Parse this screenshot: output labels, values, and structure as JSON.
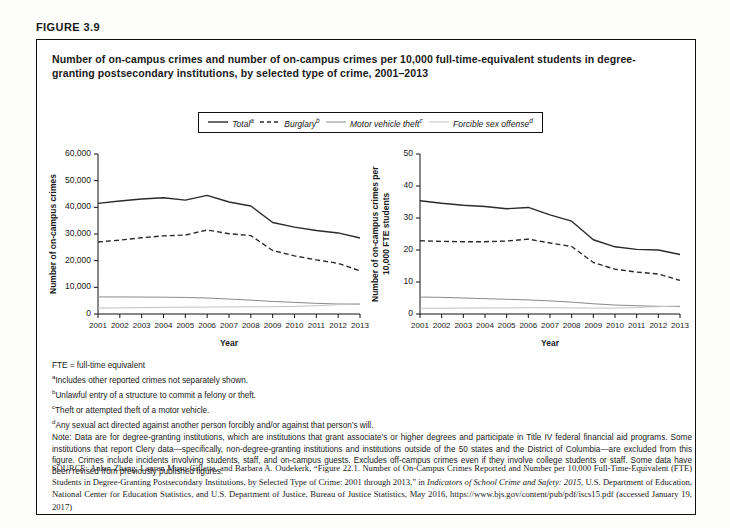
{
  "figure_label": "FIGURE 3.9",
  "title": "Number of on-campus crimes and number of on-campus crimes per 10,000 full-time-equivalent students in degree-granting postsecondary institutions, by selected type of crime, 2001–2013",
  "legend": {
    "position": "top-center-boxed",
    "entries": [
      {
        "label": "Total",
        "sup": "a",
        "style": "solid",
        "color": "#2a2a2a",
        "width": 1.4
      },
      {
        "label": "Burglary",
        "sup": "b",
        "style": "dashed",
        "color": "#2a2a2a",
        "width": 1.4
      },
      {
        "label": "Motor vehicle theft",
        "sup": "c",
        "style": "solid",
        "color": "#8a8a8a",
        "width": 1.0
      },
      {
        "label": "Forcible sex offense",
        "sup": "d",
        "style": "solid",
        "color": "#c2c2c2",
        "width": 1.0
      }
    ]
  },
  "chart_data": [
    {
      "type": "line",
      "panel": "left",
      "title": "",
      "xlabel": "Year",
      "ylabel": "Number of on-campus crimes",
      "x": [
        2001,
        2002,
        2003,
        2004,
        2005,
        2006,
        2007,
        2008,
        2009,
        2010,
        2011,
        2012,
        2013
      ],
      "xticklabels": [
        "2001",
        "2002",
        "2003",
        "2004",
        "2005",
        "2006",
        "2007",
        "2008",
        "2009",
        "2010",
        "2011",
        "2012",
        "2013"
      ],
      "ylim": [
        0,
        60000
      ],
      "yticks": [
        0,
        10000,
        20000,
        30000,
        40000,
        50000,
        60000
      ],
      "yticklabels": [
        "0",
        "10,000",
        "20,000",
        "30,000",
        "40,000",
        "50,000",
        "60,000"
      ],
      "grid": false,
      "series": [
        {
          "name": "Total",
          "sup": "a",
          "style": "solid",
          "color": "#2a2a2a",
          "width": 1.4,
          "values": [
            41500,
            42400,
            43100,
            43600,
            42700,
            44500,
            42000,
            40500,
            34300,
            32600,
            31300,
            30400,
            28500
          ]
        },
        {
          "name": "Burglary",
          "sup": "b",
          "style": "dashed",
          "color": "#2a2a2a",
          "width": 1.4,
          "values": [
            27000,
            27700,
            28600,
            29300,
            29600,
            31500,
            30100,
            29400,
            23800,
            21800,
            20300,
            19000,
            16200
          ]
        },
        {
          "name": "Motor vehicle theft",
          "sup": "c",
          "style": "solid",
          "color": "#8a8a8a",
          "width": 1.0,
          "values": [
            6400,
            6400,
            6350,
            6300,
            6200,
            6000,
            5600,
            5200,
            4700,
            4350,
            4000,
            3750,
            3700
          ]
        },
        {
          "name": "Forcible sex offense",
          "sup": "d",
          "style": "solid",
          "color": "#c2c2c2",
          "width": 1.0,
          "values": [
            2200,
            2300,
            2400,
            2500,
            2550,
            2600,
            2650,
            2700,
            2750,
            2850,
            3100,
            3500,
            3900
          ]
        }
      ]
    },
    {
      "type": "line",
      "panel": "right",
      "title": "",
      "xlabel": "Year",
      "ylabel": "Number of on-campus crimes per 10,000 FTE students",
      "x": [
        2001,
        2002,
        2003,
        2004,
        2005,
        2006,
        2007,
        2008,
        2009,
        2010,
        2011,
        2012,
        2013
      ],
      "xticklabels": [
        "2001",
        "2002",
        "2003",
        "2004",
        "2005",
        "2006",
        "2007",
        "2008",
        "2009",
        "2010",
        "2011",
        "2012",
        "2013"
      ],
      "ylim": [
        0,
        50
      ],
      "yticks": [
        0,
        10,
        20,
        30,
        40,
        50
      ],
      "yticklabels": [
        "0",
        "10",
        "20",
        "30",
        "40",
        "50"
      ],
      "grid": false,
      "series": [
        {
          "name": "Total",
          "sup": "a",
          "style": "solid",
          "color": "#2a2a2a",
          "width": 1.4,
          "values": [
            35.4,
            34.6,
            34.0,
            33.6,
            32.9,
            33.3,
            31.0,
            29.0,
            23.2,
            21.0,
            20.2,
            20.0,
            18.6
          ]
        },
        {
          "name": "Burglary",
          "sup": "b",
          "style": "dashed",
          "color": "#2a2a2a",
          "width": 1.4,
          "values": [
            22.9,
            22.7,
            22.6,
            22.6,
            22.8,
            23.4,
            22.2,
            21.1,
            16.1,
            14.0,
            13.1,
            12.5,
            10.5
          ]
        },
        {
          "name": "Motor vehicle theft",
          "sup": "c",
          "style": "solid",
          "color": "#8a8a8a",
          "width": 1.0,
          "values": [
            5.3,
            5.2,
            5.0,
            4.8,
            4.6,
            4.4,
            4.1,
            3.7,
            3.2,
            2.8,
            2.6,
            2.4,
            2.3
          ]
        },
        {
          "name": "Forcible sex offense",
          "sup": "d",
          "style": "solid",
          "color": "#c2c2c2",
          "width": 1.0,
          "values": [
            1.8,
            1.8,
            1.85,
            1.9,
            1.9,
            1.95,
            1.95,
            1.9,
            1.85,
            1.85,
            2.0,
            2.3,
            2.5
          ]
        }
      ]
    }
  ],
  "notes": {
    "abbrev": "FTE = full-time equivalent",
    "footnotes": [
      {
        "marker": "a",
        "text": "Includes other reported crimes not separately shown."
      },
      {
        "marker": "b",
        "text": "Unlawful entry of a structure to commit a felony or theft."
      },
      {
        "marker": "c",
        "text": "Theft or attempted theft of a motor vehicle."
      },
      {
        "marker": "d",
        "text": "Any sexual act directed against another person forcibly and/or against that person’s will."
      }
    ],
    "note": "Note: Data are for degree-granting institutions, which are institutions that grant associate’s or higher degrees and participate in Title IV federal financial aid programs. Some institutions that report Clery data—specifically, non-degree-granting institutions and institutions outside of the 50 states and the District of Columbia—are excluded from this figure. Crimes include incidents involving students, staff, and on-campus guests. Excludes off-campus crimes even if they involve college students or staff. Some data have been revised from previously published figures."
  },
  "source": {
    "label": "SOURCE:",
    "text_before_italic1": " Anlan Zhang, Lauren Musu-Gillette, and Barbara A. Oudekerk, “Figure 22.1. Number of On-Campus Crimes Reported and Number per 10,000 Full-Time-Equivalent (FTE) Students in Degree-Granting Postsecondary Institutions, by Selected Type of Crime: 2001 through 2013,” in ",
    "italic1": "Indicators of School Crime and Safety: 2015",
    "text_after_italic1": ", U.S. Department of Education, National Center for Education Statistics, and U.S. Department of Justice, Bureau of Justice Statistics, May 2016, https://www.bjs.gov/content/pub/pdf/iscs15.pdf (accessed January 19, 2017)"
  }
}
